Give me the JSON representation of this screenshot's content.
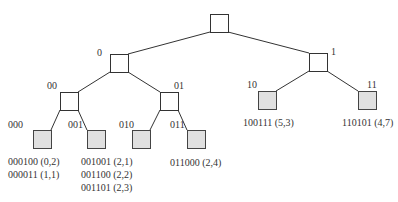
{
  "diagram": {
    "nodes": [
      {
        "id": "root",
        "label": "",
        "x": 210,
        "y": 14,
        "leaf": false
      },
      {
        "id": "n0",
        "label": "0",
        "x": 110,
        "y": 54,
        "leaf": false,
        "label_x": 97,
        "label_y": 56
      },
      {
        "id": "n1",
        "label": "1",
        "x": 309,
        "y": 53,
        "leaf": false,
        "label_x": 331,
        "label_y": 55
      },
      {
        "id": "n00",
        "label": "00",
        "x": 60,
        "y": 92,
        "leaf": false,
        "label_x": 47,
        "label_y": 89
      },
      {
        "id": "n01",
        "label": "01",
        "x": 160,
        "y": 92,
        "leaf": false,
        "label_x": 174,
        "label_y": 89
      },
      {
        "id": "n000",
        "label": "000",
        "x": 33,
        "y": 130,
        "leaf": true,
        "label_x": 8,
        "label_y": 128
      },
      {
        "id": "n001",
        "label": "001",
        "x": 87,
        "y": 130,
        "leaf": true,
        "label_x": 68,
        "label_y": 128
      },
      {
        "id": "n010",
        "label": "010",
        "x": 132,
        "y": 130,
        "leaf": true,
        "label_x": 119,
        "label_y": 128
      },
      {
        "id": "n011",
        "label": "011",
        "x": 187,
        "y": 130,
        "leaf": true,
        "label_x": 170,
        "label_y": 128
      },
      {
        "id": "n10",
        "label": "10",
        "x": 258,
        "y": 91,
        "leaf": true,
        "label_x": 247,
        "label_y": 88
      },
      {
        "id": "n11",
        "label": "11",
        "x": 358,
        "y": 91,
        "leaf": true,
        "label_x": 367,
        "label_y": 88
      }
    ],
    "edges": [
      [
        "root",
        "n0"
      ],
      [
        "root",
        "n1"
      ],
      [
        "n0",
        "n00"
      ],
      [
        "n0",
        "n01"
      ],
      [
        "n1",
        "n10"
      ],
      [
        "n1",
        "n11"
      ],
      [
        "n00",
        "n000"
      ],
      [
        "n00",
        "n001"
      ],
      [
        "n01",
        "n010"
      ],
      [
        "n01",
        "n011"
      ]
    ],
    "buckets": [
      {
        "node": "n000",
        "x": 8,
        "y": 165,
        "entries": [
          "000100 (0,2)",
          "000011 (1,1)"
        ]
      },
      {
        "node": "n001",
        "x": 81,
        "y": 165,
        "entries": [
          "001001 (2,1)",
          "001100 (2,2)",
          "001101 (2,3)"
        ]
      },
      {
        "node": "n010",
        "x": 0,
        "y": 0,
        "entries": []
      },
      {
        "node": "n011",
        "x": 170,
        "y": 166,
        "entries": [
          "011000 (2,4)"
        ]
      },
      {
        "node": "n10",
        "x": 243,
        "y": 126,
        "entries": [
          "100111 (5,3)"
        ]
      },
      {
        "node": "n11",
        "x": 342,
        "y": 126,
        "entries": [
          "110101 (4,7)"
        ]
      }
    ]
  }
}
